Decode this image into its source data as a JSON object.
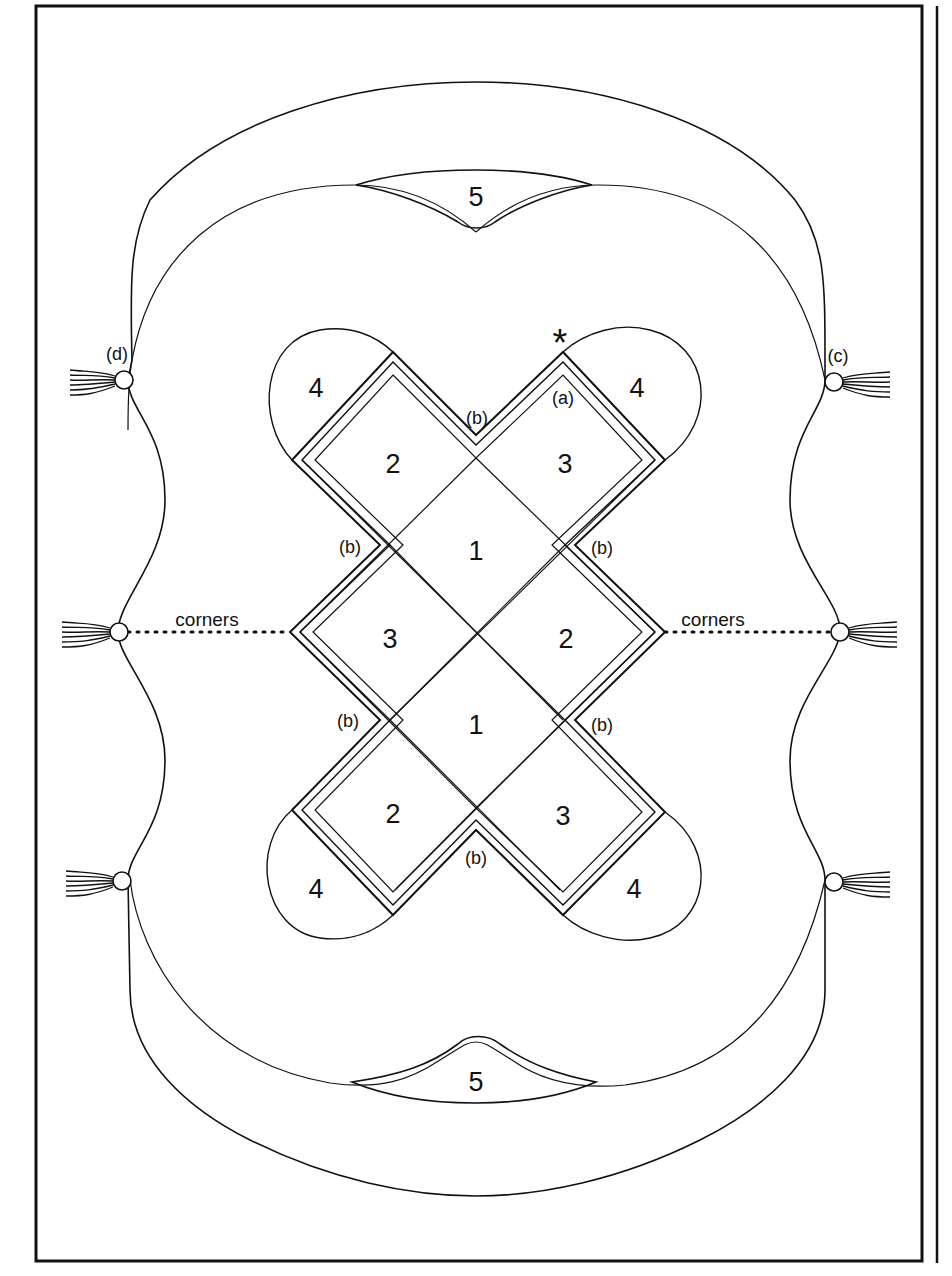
{
  "diagram": {
    "type": "pattern-schematic",
    "colors": {
      "ink": "#111111",
      "paper": "#ffffff"
    },
    "center_squares": [
      {
        "label": "1",
        "position": "center-upper"
      },
      {
        "label": "1",
        "position": "center-lower"
      },
      {
        "label": "2",
        "position": "upper-left"
      },
      {
        "label": "3",
        "position": "upper-right"
      },
      {
        "label": "3",
        "position": "middle-left"
      },
      {
        "label": "2",
        "position": "middle-right"
      },
      {
        "label": "2",
        "position": "lower-left"
      },
      {
        "label": "3",
        "position": "lower-right"
      }
    ],
    "corner_lobes": [
      {
        "label": "4",
        "position": "top-left"
      },
      {
        "label": "4",
        "position": "top-right"
      },
      {
        "label": "4",
        "position": "bottom-left"
      },
      {
        "label": "4",
        "position": "bottom-right"
      }
    ],
    "border_panels": [
      {
        "label": "5",
        "position": "top"
      },
      {
        "label": "5",
        "position": "bottom"
      }
    ],
    "annotations": {
      "a": "(a)",
      "b": "(b)",
      "c": "(c)",
      "d": "(d)",
      "star": "*",
      "corners_left": "corners",
      "corners_right": "corners"
    },
    "tassels": [
      {
        "position": "left-top",
        "tag": "(d)"
      },
      {
        "position": "left-middle"
      },
      {
        "position": "left-bottom"
      },
      {
        "position": "right-top",
        "tag": "(c)"
      },
      {
        "position": "right-middle"
      },
      {
        "position": "right-bottom"
      }
    ]
  }
}
